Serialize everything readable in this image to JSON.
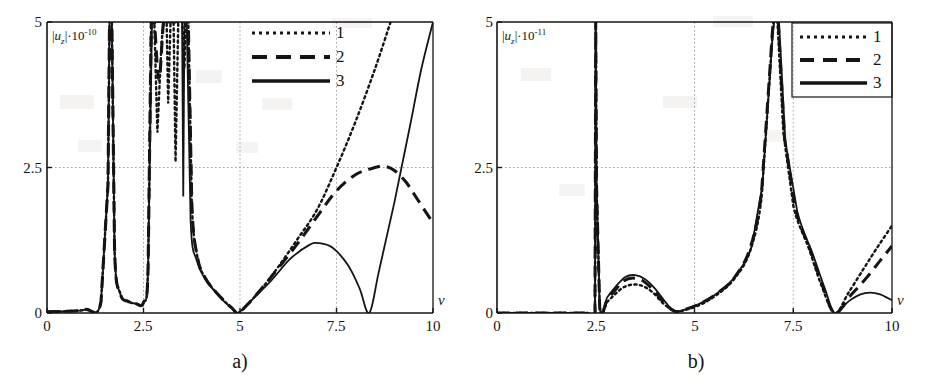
{
  "figure": {
    "background": "#ffffff",
    "ink": "#141414",
    "grid_color": "#9a9a9a"
  },
  "panels": [
    {
      "id": "a",
      "caption": "a)",
      "ylabel": {
        "prefix": "|",
        "variable": "u",
        "subscript": "z",
        "suffix": "|·10",
        "exponent": "-10"
      },
      "xlabel": "ν",
      "xticks": [
        "0",
        "2.5",
        "5",
        "7.5",
        "10"
      ],
      "yticks": [
        "0",
        "2.5",
        "5"
      ],
      "legend": [
        {
          "label": "1",
          "style": "dotted"
        },
        {
          "label": "2",
          "style": "dashed"
        },
        {
          "label": "3",
          "style": "solid"
        }
      ]
    },
    {
      "id": "b",
      "caption": "b)",
      "ylabel": {
        "prefix": "|",
        "variable": "u",
        "subscript": "z",
        "suffix": "|·10",
        "exponent": "-11"
      },
      "xlabel": "ν",
      "xticks": [
        "0",
        "2.5",
        "5",
        "7.5",
        "10"
      ],
      "yticks": [
        "0",
        "2.5",
        "5"
      ],
      "legend": [
        {
          "label": "1",
          "style": "dotted"
        },
        {
          "label": "2",
          "style": "dashed"
        },
        {
          "label": "3",
          "style": "solid"
        }
      ]
    }
  ],
  "chart_data": [
    {
      "type": "line",
      "panel": "a",
      "title": "",
      "xlabel": "ν",
      "ylabel": "|u_z|·10^-10",
      "xlim": [
        0,
        10
      ],
      "ylim": [
        0,
        5
      ],
      "xticks": [
        0,
        2.5,
        5,
        7.5,
        10
      ],
      "yticks": [
        0,
        2.5,
        5
      ],
      "grid": true,
      "legend_position": "top-center",
      "series": [
        {
          "name": "1",
          "style": "dotted",
          "poles": [
            1.62,
            2.72,
            3.02,
            3.22,
            3.42,
            3.58
          ],
          "zeros": [
            4.95
          ],
          "description": "dotted curve; vanishes at 4.95, rises steeply after 5 passing 2.5 at 7.5 and exceeding 5 near 8.9",
          "points": [
            [
              0.0,
              0.02
            ],
            [
              0.5,
              0.03
            ],
            [
              1.0,
              0.06
            ],
            [
              1.4,
              0.2
            ],
            [
              1.58,
              2.2
            ],
            [
              1.62,
              5.0
            ],
            [
              1.68,
              5.0
            ],
            [
              1.75,
              1.1
            ],
            [
              1.9,
              0.33
            ],
            [
              2.1,
              0.2
            ],
            [
              2.3,
              0.16
            ],
            [
              2.5,
              0.18
            ],
            [
              2.62,
              0.8
            ],
            [
              2.7,
              5.0
            ],
            [
              2.78,
              5.0
            ],
            [
              2.86,
              3.1
            ],
            [
              2.95,
              4.4
            ],
            [
              3.02,
              5.0
            ],
            [
              3.1,
              5.0
            ],
            [
              3.14,
              3.6
            ],
            [
              3.2,
              5.0
            ],
            [
              3.28,
              5.0
            ],
            [
              3.33,
              2.6
            ],
            [
              3.4,
              5.0
            ],
            [
              3.5,
              5.0
            ],
            [
              3.56,
              4.2
            ],
            [
              3.6,
              5.0
            ],
            [
              3.66,
              5.0
            ],
            [
              3.75,
              1.9
            ],
            [
              3.9,
              0.95
            ],
            [
              4.1,
              0.6
            ],
            [
              4.35,
              0.38
            ],
            [
              4.6,
              0.2
            ],
            [
              4.8,
              0.08
            ],
            [
              4.95,
              0.0
            ],
            [
              5.2,
              0.15
            ],
            [
              5.6,
              0.45
            ],
            [
              6.0,
              0.8
            ],
            [
              6.5,
              1.28
            ],
            [
              7.0,
              1.78
            ],
            [
              7.5,
              2.5
            ],
            [
              8.0,
              3.3
            ],
            [
              8.5,
              4.2
            ],
            [
              8.9,
              5.0
            ]
          ]
        },
        {
          "name": "2",
          "style": "dashed",
          "poles": [
            1.62,
            2.72,
            3.02,
            3.22,
            3.42,
            3.58
          ],
          "zeros": [
            4.95
          ],
          "description": "dashed curve; follows 1 until ~6, then bends over peaking at 2.5 near 8.7 and decreasing to 1.55 at 10",
          "points": [
            [
              0.0,
              0.02
            ],
            [
              0.5,
              0.03
            ],
            [
              1.0,
              0.06
            ],
            [
              1.4,
              0.2
            ],
            [
              1.58,
              2.2
            ],
            [
              1.62,
              5.0
            ],
            [
              1.68,
              5.0
            ],
            [
              1.75,
              1.1
            ],
            [
              1.9,
              0.33
            ],
            [
              2.1,
              0.2
            ],
            [
              2.3,
              0.16
            ],
            [
              2.5,
              0.18
            ],
            [
              2.62,
              0.8
            ],
            [
              2.7,
              5.0
            ],
            [
              2.78,
              5.0
            ],
            [
              2.9,
              4.0
            ],
            [
              3.02,
              5.0
            ],
            [
              3.12,
              5.0
            ],
            [
              3.22,
              5.0
            ],
            [
              3.32,
              5.0
            ],
            [
              3.42,
              5.0
            ],
            [
              3.52,
              5.0
            ],
            [
              3.6,
              5.0
            ],
            [
              3.66,
              5.0
            ],
            [
              3.75,
              1.9
            ],
            [
              3.9,
              0.95
            ],
            [
              4.1,
              0.6
            ],
            [
              4.35,
              0.38
            ],
            [
              4.6,
              0.2
            ],
            [
              4.8,
              0.08
            ],
            [
              4.95,
              0.0
            ],
            [
              5.2,
              0.15
            ],
            [
              5.6,
              0.45
            ],
            [
              6.0,
              0.78
            ],
            [
              6.5,
              1.2
            ],
            [
              7.0,
              1.66
            ],
            [
              7.5,
              2.1
            ],
            [
              8.0,
              2.38
            ],
            [
              8.5,
              2.5
            ],
            [
              8.75,
              2.52
            ],
            [
              9.0,
              2.45
            ],
            [
              9.3,
              2.25
            ],
            [
              9.6,
              1.95
            ],
            [
              10.0,
              1.55
            ]
          ]
        },
        {
          "name": "3",
          "style": "solid",
          "poles": [
            1.62,
            3.55
          ],
          "zeros": [
            4.95,
            8.35
          ],
          "description": "solid curve; bump peaking 1.2 at 7.0, zero at 8.35 then rising steeply past 5 at 10",
          "points": [
            [
              0.0,
              0.02
            ],
            [
              0.5,
              0.03
            ],
            [
              1.0,
              0.06
            ],
            [
              1.4,
              0.2
            ],
            [
              1.58,
              2.2
            ],
            [
              1.62,
              5.0
            ],
            [
              1.68,
              5.0
            ],
            [
              1.75,
              1.1
            ],
            [
              1.9,
              0.33
            ],
            [
              2.1,
              0.2
            ],
            [
              2.3,
              0.16
            ],
            [
              2.5,
              0.18
            ],
            [
              2.62,
              0.8
            ],
            [
              2.72,
              5.0
            ],
            [
              2.8,
              5.0
            ],
            [
              3.4,
              5.0
            ],
            [
              3.5,
              5.0
            ],
            [
              3.53,
              2.0
            ],
            [
              3.56,
              5.0
            ],
            [
              3.62,
              5.0
            ],
            [
              3.72,
              1.6
            ],
            [
              3.88,
              0.9
            ],
            [
              4.1,
              0.58
            ],
            [
              4.35,
              0.37
            ],
            [
              4.6,
              0.19
            ],
            [
              4.8,
              0.08
            ],
            [
              4.95,
              0.0
            ],
            [
              5.3,
              0.22
            ],
            [
              5.8,
              0.55
            ],
            [
              6.3,
              0.93
            ],
            [
              6.8,
              1.17
            ],
            [
              7.05,
              1.2
            ],
            [
              7.4,
              1.12
            ],
            [
              7.8,
              0.82
            ],
            [
              8.1,
              0.42
            ],
            [
              8.35,
              0.0
            ],
            [
              8.6,
              0.72
            ],
            [
              9.0,
              1.9
            ],
            [
              9.4,
              3.2
            ],
            [
              9.7,
              4.2
            ],
            [
              10.0,
              5.0
            ]
          ]
        }
      ]
    },
    {
      "type": "line",
      "panel": "b",
      "title": "",
      "xlabel": "ν",
      "ylabel": "|u_z|·10^-11",
      "xlim": [
        0,
        10
      ],
      "ylim": [
        0,
        5
      ],
      "xticks": [
        0,
        2.5,
        5,
        7.5,
        10
      ],
      "yticks": [
        0,
        2.5,
        5
      ],
      "grid": true,
      "legend_position": "top-right",
      "series": [
        {
          "name": "1",
          "style": "dotted",
          "poles": [
            2.5,
            7.02
          ],
          "zeros": [
            4.5,
            8.55
          ],
          "description": "dotted; zero below 2.5, small bump 0.5 at 3.5, pole at 7.02, zero 8.55, rises to 1.5 at 10",
          "points": [
            [
              0.0,
              0.0
            ],
            [
              1.5,
              0.0
            ],
            [
              2.3,
              0.0
            ],
            [
              2.48,
              0.0
            ],
            [
              2.5,
              5.0
            ],
            [
              2.52,
              2.2
            ],
            [
              2.6,
              0.1
            ],
            [
              2.8,
              0.2
            ],
            [
              3.0,
              0.33
            ],
            [
              3.2,
              0.44
            ],
            [
              3.45,
              0.49
            ],
            [
              3.7,
              0.46
            ],
            [
              3.95,
              0.35
            ],
            [
              4.2,
              0.17
            ],
            [
              4.5,
              0.03
            ],
            [
              4.8,
              0.06
            ],
            [
              5.2,
              0.16
            ],
            [
              5.6,
              0.33
            ],
            [
              6.0,
              0.58
            ],
            [
              6.4,
              1.05
            ],
            [
              6.7,
              2.0
            ],
            [
              6.9,
              4.0
            ],
            [
              7.0,
              5.0
            ],
            [
              7.1,
              5.0
            ],
            [
              7.25,
              3.1
            ],
            [
              7.5,
              1.85
            ],
            [
              7.9,
              1.1
            ],
            [
              8.2,
              0.5
            ],
            [
              8.55,
              0.0
            ],
            [
              8.9,
              0.35
            ],
            [
              9.3,
              0.78
            ],
            [
              9.65,
              1.15
            ],
            [
              10.0,
              1.5
            ]
          ]
        },
        {
          "name": "2",
          "style": "dashed",
          "poles": [
            2.5,
            7.02
          ],
          "zeros": [
            4.5,
            8.55
          ],
          "description": "dashed; nearly coincident with 3 on the bump, rises to 1.15 at 10",
          "points": [
            [
              0.0,
              0.0
            ],
            [
              1.5,
              0.0
            ],
            [
              2.3,
              0.0
            ],
            [
              2.48,
              0.0
            ],
            [
              2.5,
              5.0
            ],
            [
              2.52,
              2.2
            ],
            [
              2.6,
              0.1
            ],
            [
              2.8,
              0.24
            ],
            [
              3.0,
              0.4
            ],
            [
              3.2,
              0.55
            ],
            [
              3.45,
              0.6
            ],
            [
              3.7,
              0.55
            ],
            [
              3.95,
              0.4
            ],
            [
              4.2,
              0.2
            ],
            [
              4.5,
              0.03
            ],
            [
              4.8,
              0.07
            ],
            [
              5.2,
              0.18
            ],
            [
              5.6,
              0.35
            ],
            [
              6.0,
              0.6
            ],
            [
              6.4,
              1.1
            ],
            [
              6.7,
              2.1
            ],
            [
              6.9,
              4.1
            ],
            [
              7.0,
              5.0
            ],
            [
              7.12,
              5.0
            ],
            [
              7.28,
              3.0
            ],
            [
              7.55,
              1.8
            ],
            [
              7.95,
              1.05
            ],
            [
              8.25,
              0.45
            ],
            [
              8.55,
              0.0
            ],
            [
              8.95,
              0.3
            ],
            [
              9.35,
              0.6
            ],
            [
              9.7,
              0.9
            ],
            [
              10.0,
              1.15
            ]
          ]
        },
        {
          "name": "3",
          "style": "solid",
          "poles": [
            2.5,
            7.02
          ],
          "zeros": [
            4.5,
            8.55
          ],
          "description": "solid; bump 0.65 at 3.5, pole at 7.02, zero at 8.55 then low bump 0.35 at 9.4 falling to 0.2 at 10",
          "points": [
            [
              0.0,
              0.0
            ],
            [
              1.5,
              0.0
            ],
            [
              2.3,
              0.0
            ],
            [
              2.48,
              0.0
            ],
            [
              2.5,
              5.0
            ],
            [
              2.52,
              2.2
            ],
            [
              2.6,
              0.12
            ],
            [
              2.8,
              0.28
            ],
            [
              3.0,
              0.45
            ],
            [
              3.25,
              0.62
            ],
            [
              3.5,
              0.65
            ],
            [
              3.75,
              0.58
            ],
            [
              4.0,
              0.42
            ],
            [
              4.25,
              0.2
            ],
            [
              4.5,
              0.03
            ],
            [
              4.85,
              0.08
            ],
            [
              5.25,
              0.2
            ],
            [
              5.65,
              0.38
            ],
            [
              6.05,
              0.65
            ],
            [
              6.45,
              1.15
            ],
            [
              6.72,
              2.2
            ],
            [
              6.92,
              4.2
            ],
            [
              7.02,
              5.0
            ],
            [
              7.14,
              5.0
            ],
            [
              7.3,
              2.95
            ],
            [
              7.6,
              1.75
            ],
            [
              8.0,
              1.0
            ],
            [
              8.3,
              0.42
            ],
            [
              8.55,
              0.0
            ],
            [
              8.9,
              0.2
            ],
            [
              9.2,
              0.32
            ],
            [
              9.45,
              0.35
            ],
            [
              9.7,
              0.32
            ],
            [
              10.0,
              0.22
            ]
          ]
        }
      ]
    }
  ]
}
